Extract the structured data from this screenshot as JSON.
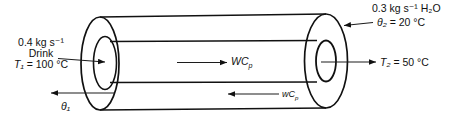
{
  "figure": {
    "hot_stream": {
      "flow_rate": "0.4 kg s⁻¹",
      "name": "Drink",
      "inlet_temp_var": "T₁",
      "inlet_temp_value": "= 100 °C",
      "outlet_temp_var": "T₂",
      "outlet_temp_value": "= 50 °C",
      "capacity_rate": "WC",
      "capacity_rate_sub": "p"
    },
    "cold_stream": {
      "flow_rate": "0.3 kg s⁻¹ H₂O",
      "inlet_temp_var": "θ₂",
      "inlet_temp_value": "= 20 °C",
      "outlet_temp_var": "θ₁",
      "capacity_rate": "wC",
      "capacity_rate_sub": "p"
    },
    "colors": {
      "stroke": "#111111",
      "background": "#ffffff",
      "text": "#111111"
    }
  }
}
